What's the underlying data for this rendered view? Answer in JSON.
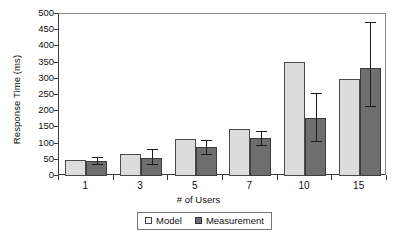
{
  "chart_data": {
    "type": "bar",
    "title": "",
    "xlabel": "# of Users",
    "ylabel": "Response Time (ms)",
    "categories": [
      "1",
      "3",
      "5",
      "7",
      "10",
      "15"
    ],
    "ylim": [
      0,
      500
    ],
    "yticks": [
      0,
      50,
      100,
      150,
      200,
      250,
      300,
      350,
      400,
      450,
      500
    ],
    "grid": false,
    "legend_position": "bottom",
    "series": [
      {
        "name": "Model",
        "color": "#dcdcdc",
        "values": [
          50,
          68,
          115,
          146,
          351,
          298
        ],
        "errors": [
          null,
          null,
          null,
          null,
          null,
          null
        ]
      },
      {
        "name": "Measurement",
        "color": "#6e6e6e",
        "values": [
          47,
          56,
          90,
          118,
          180,
          332
        ],
        "error_low": [
          37,
          36,
          68,
          97,
          109,
          217
        ],
        "error_high": [
          60,
          84,
          112,
          140,
          255,
          475
        ]
      }
    ]
  },
  "axis": {
    "y_title": "Response Time (ms)",
    "x_title": "# of Users",
    "y_tick_labels": [
      "500",
      "450",
      "400",
      "350",
      "300",
      "250",
      "200",
      "150",
      "100",
      "50",
      "0"
    ],
    "x_tick_labels": [
      "1",
      "3",
      "5",
      "7",
      "10",
      "15"
    ]
  },
  "legend": {
    "items": [
      {
        "label": "Model"
      },
      {
        "label": "Measurement"
      }
    ]
  }
}
